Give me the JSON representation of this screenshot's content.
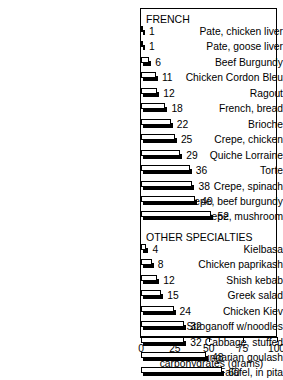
{
  "chart_data": {
    "type": "bar",
    "orientation": "horizontal",
    "title": "CARBOHYDRATES",
    "xlabel": "carbohydrates (grams)",
    "ylabel": "",
    "xlim": [
      0,
      100
    ],
    "xticks": [
      0,
      25,
      50,
      75,
      100
    ],
    "xtick_labels": [
      "0",
      "25",
      "50",
      "75",
      "100"
    ],
    "grid": false,
    "legend": "none",
    "sections": [
      {
        "name": "FRENCH",
        "categories": [
          "Pate, chicken liver",
          "Pate, goose liver",
          "Beef Burgundy",
          "Chicken Cordon Bleu",
          "Ragout",
          "French, bread",
          "Brioche",
          "Crepe, chicken",
          "Quiche Lorraine",
          "Torte",
          "Crepe, spinach",
          "Crepe, beef burgundy",
          "Crepe, mushroom"
        ],
        "values": [
          1,
          1,
          6,
          11,
          12,
          18,
          22,
          25,
          29,
          36,
          38,
          40,
          52
        ]
      },
      {
        "name": "OTHER SPECIALTIES",
        "categories": [
          "Kielbasa",
          "Chicken paprikash",
          "Shish kebab",
          "Greek salad",
          "Chicken Kiev",
          "Beef Stroganoff w/noodles",
          "Cabbage, stuffed",
          "Hungarian goulash",
          "Falafel, in pita",
          "Cherry soup, cold"
        ],
        "values": [
          4,
          8,
          12,
          15,
          24,
          32,
          32,
          48,
          60,
          82
        ]
      }
    ]
  },
  "colors": {
    "bar_face": "#ffffff",
    "bar_shadow": "#000000",
    "frame": "#000000",
    "text": "#000000",
    "background": "#ffffff"
  }
}
